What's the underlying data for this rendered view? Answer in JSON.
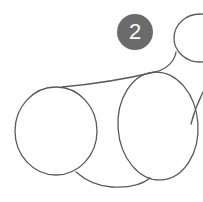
{
  "step": {
    "number": "2",
    "badge_color": "#6b6b6b",
    "badge_text_color": "#ffffff"
  },
  "drawing": {
    "subject": "sketch outline of body shapes",
    "stroke_color": "#5a5a5a",
    "shapes": [
      "left-circle",
      "center-oval",
      "head-oval-top-right",
      "back-connecting-curve",
      "belly-connecting-curve",
      "right-leg-line"
    ]
  }
}
